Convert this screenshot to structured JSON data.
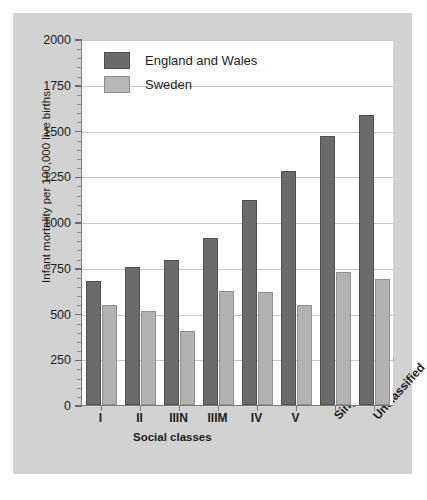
{
  "chart_data": {
    "type": "bar",
    "title": "",
    "xlabel": "Social classes",
    "ylabel": "Infant mortality per 100,000 live births",
    "categories": [
      "I",
      "II",
      "IIIN",
      "IIIM",
      "IV",
      "V",
      "Single parents",
      "Unclassified"
    ],
    "series": [
      {
        "name": "England and Wales",
        "color": "#6b6b6b",
        "values": [
          675,
          755,
          790,
          910,
          1120,
          1280,
          1470,
          1585
        ]
      },
      {
        "name": "Sweden",
        "color": "#b2b2b2",
        "values": [
          545,
          515,
          405,
          625,
          615,
          545,
          725,
          690
        ]
      }
    ],
    "ylim": [
      0,
      2000
    ],
    "yticks": [
      0,
      250,
      500,
      750,
      1000,
      1250,
      1500,
      1750,
      2000
    ],
    "ytick_labels": [
      "0",
      "250",
      "500",
      "750",
      "1000",
      "1250",
      "1500",
      "1750",
      "2000"
    ],
    "y_minor_step": 50,
    "grid": "horizontal",
    "legend_position": "top-left",
    "rotated_category_labels": [
      "Single parents",
      "Unclassified"
    ]
  },
  "legend": {
    "items": [
      {
        "label": "England and Wales",
        "swatch": "ew"
      },
      {
        "label": "Sweden",
        "swatch": "se"
      }
    ]
  },
  "colors": {
    "england_and_wales": "#6b6b6b",
    "sweden": "#b2b2b2",
    "figure_background": "#d2d2d2",
    "plot_background": "#ffffff",
    "gridline": "#c8c8c8",
    "axis": "#7a7a7a",
    "text": "#1d1d1d"
  }
}
